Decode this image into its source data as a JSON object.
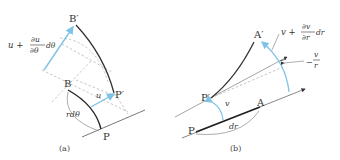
{
  "colors": {
    "blue": "#7ec3e6",
    "dark": "#333333",
    "thin": "#555555",
    "dashed": "#b5b5b5"
  },
  "panel_a": {
    "caption": "(a)",
    "points": {
      "B_prime": "B′",
      "B": "B",
      "P_prime": "P′",
      "P": "P"
    },
    "labels": {
      "u_plus": "u +",
      "du_num": "∂u",
      "du_den": "∂θ",
      "dtheta": "dθ",
      "u": "u",
      "rdtheta": "rdθ"
    }
  },
  "panel_b": {
    "caption": "(b)",
    "points": {
      "A_prime": "A′",
      "P_prime": "P′",
      "A": "A",
      "P": "P"
    },
    "labels": {
      "v_plus": "v +",
      "dv_num": "∂v",
      "dv_den": "∂r",
      "dr_top": "dr",
      "v_over_num": "v",
      "v_over_den": "r",
      "minus": "−",
      "v": "v",
      "dr": "dr"
    }
  }
}
